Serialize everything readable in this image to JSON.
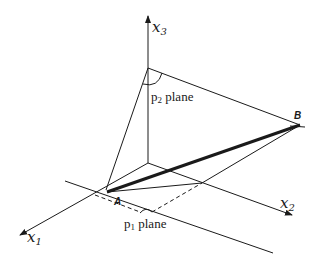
{
  "diagram": {
    "title": "",
    "axes": [
      {
        "id": "x1",
        "name": "x",
        "subscript": "1"
      },
      {
        "id": "x2",
        "name": "x",
        "subscript": "2"
      },
      {
        "id": "x3",
        "name": "x",
        "subscript": "3"
      }
    ],
    "points": [
      {
        "id": "A",
        "label": "A"
      },
      {
        "id": "B",
        "label": "B"
      }
    ],
    "planes": [
      {
        "id": "p1",
        "prefix": "p",
        "subscript": "1",
        "suffix": " plane"
      },
      {
        "id": "p2",
        "prefix": "p",
        "subscript": "2",
        "suffix": " plane"
      }
    ],
    "colors": {
      "stroke": "#1a1a1a",
      "background": "#ffffff"
    }
  }
}
